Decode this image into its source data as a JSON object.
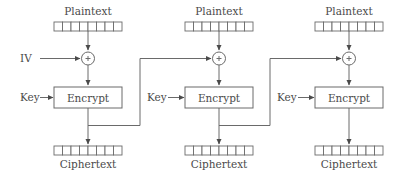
{
  "diagram": {
    "colors": {
      "stroke": "#6a6a6a",
      "text": "#4a4a4a",
      "background": "#ffffff"
    },
    "iv_label": "IV",
    "blocks": [
      {
        "plaintext_label": "Plaintext",
        "key_label": "Key",
        "cipher_label": "Encrypt",
        "ciphertext_label": "Ciphertext",
        "xor_icon": "xor-icon"
      },
      {
        "plaintext_label": "Plaintext",
        "key_label": "Key",
        "cipher_label": "Encrypt",
        "ciphertext_label": "Ciphertext",
        "xor_icon": "xor-icon"
      },
      {
        "plaintext_label": "Plaintext",
        "key_label": "Key",
        "cipher_label": "Encrypt",
        "ciphertext_label": "Ciphertext",
        "xor_icon": "xor-icon"
      }
    ],
    "register_cells": 8
  }
}
